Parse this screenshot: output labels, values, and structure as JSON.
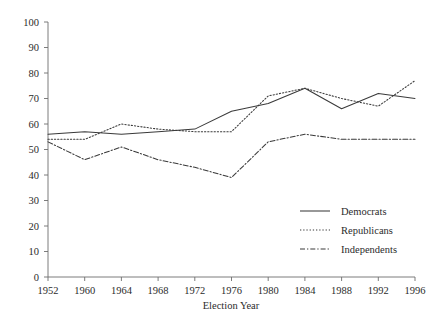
{
  "chart_data": {
    "type": "line",
    "title": "",
    "xlabel": "Election Year",
    "ylabel": "",
    "categories": [
      1952,
      1960,
      1964,
      1968,
      1972,
      1976,
      1980,
      1984,
      1988,
      1992,
      1996
    ],
    "xtick_labels": [
      "1952",
      "1960",
      "1964",
      "1968",
      "1972",
      "1976",
      "1980",
      "1984",
      "1988",
      "1992",
      "1996"
    ],
    "ytick_labels": [
      "0",
      "10",
      "20",
      "30",
      "40",
      "50",
      "60",
      "70",
      "80",
      "90",
      "100"
    ],
    "yticks": [
      0,
      10,
      20,
      30,
      40,
      50,
      60,
      70,
      80,
      90,
      100
    ],
    "ylim": [
      0,
      100
    ],
    "grid": false,
    "legend_position": "lower-right",
    "series": [
      {
        "name": "Democrats",
        "style": "solid",
        "color": "#3a3a3a",
        "values": [
          56,
          57,
          56,
          57,
          58,
          65,
          68,
          74,
          66,
          72,
          70
        ]
      },
      {
        "name": "Republicans",
        "style": "dotted",
        "color": "#3a3a3a",
        "values": [
          54,
          54,
          60,
          58,
          57,
          57,
          71,
          74,
          70,
          67,
          77
        ]
      },
      {
        "name": "Independents",
        "style": "dashdot",
        "color": "#3a3a3a",
        "values": [
          53,
          46,
          51,
          46,
          43,
          39,
          53,
          56,
          54,
          54,
          54
        ]
      }
    ]
  },
  "legend": {
    "items": [
      {
        "label": "Democrats"
      },
      {
        "label": "Republicans"
      },
      {
        "label": "Independents"
      }
    ]
  },
  "axes": {
    "x_title": "Election Year"
  }
}
